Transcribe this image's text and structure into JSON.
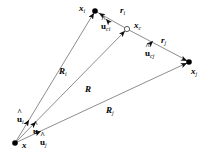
{
  "figure": {
    "background_color": "#ffffff",
    "line_color": "#7a7a7a",
    "node_color": "#000000",
    "text_color": "#000000",
    "width": 215,
    "height": 159
  },
  "labels": {
    "origin": {
      "base": "x",
      "sub": "",
      "hat": ""
    },
    "point_i": {
      "base": "x",
      "sub": "i",
      "hat": ""
    },
    "point_c": {
      "base": "x",
      "sub": "c",
      "hat": ""
    },
    "point_j": {
      "base": "x",
      "sub": "j",
      "hat": ""
    },
    "vec_R_i": {
      "base": "R",
      "sub": "i",
      "hat": ""
    },
    "vec_R": {
      "base": "R",
      "sub": "",
      "hat": ""
    },
    "vec_R_j": {
      "base": "R",
      "sub": "j",
      "hat": ""
    },
    "vec_r_i": {
      "base": "r",
      "sub": "i",
      "hat": ""
    },
    "vec_r_j": {
      "base": "r",
      "sub": "j",
      "hat": ""
    },
    "unit_u_i": {
      "base": "u",
      "sub": "i",
      "hat": "^"
    },
    "unit_u": {
      "base": "u",
      "sub": "",
      "hat": "^"
    },
    "unit_u_j": {
      "base": "u",
      "sub": "j",
      "hat": "^"
    },
    "unit_u_ci": {
      "base": "u",
      "sub": "ci",
      "hat": "^"
    },
    "unit_u_cj": {
      "base": "u",
      "sub": "cj",
      "hat": "^"
    }
  },
  "geometry": {
    "nodes": [
      {
        "name": "origin",
        "x": 15,
        "y": 143,
        "style": "filled"
      },
      {
        "name": "point_i",
        "x": 95,
        "y": 11,
        "style": "filled"
      },
      {
        "name": "point_c",
        "x": 127,
        "y": 29,
        "style": "open"
      },
      {
        "name": "point_j",
        "x": 189,
        "y": 62,
        "style": "filled"
      }
    ],
    "edges": [
      {
        "name": "R_i",
        "from": "origin",
        "to": "point_i"
      },
      {
        "name": "R",
        "from": "origin",
        "to": "point_c"
      },
      {
        "name": "R_j",
        "from": "origin",
        "to": "point_j"
      },
      {
        "name": "r_i",
        "from": "point_c",
        "to": "point_i"
      },
      {
        "name": "r_j",
        "from": "point_c",
        "to": "point_j"
      }
    ]
  }
}
